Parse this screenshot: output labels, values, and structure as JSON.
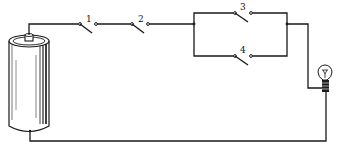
{
  "diagram": {
    "type": "electrical circuit",
    "components": {
      "battery": {
        "name": "dry cell battery"
      },
      "bulb": {
        "name": "light bulb"
      },
      "switches": [
        {
          "id": "switch-1",
          "label": "1",
          "arrangement": "series",
          "state": "open"
        },
        {
          "id": "switch-2",
          "label": "2",
          "arrangement": "series",
          "state": "open"
        },
        {
          "id": "switch-3",
          "label": "3",
          "arrangement": "parallel-upper",
          "state": "open"
        },
        {
          "id": "switch-4",
          "label": "4",
          "arrangement": "parallel-lower",
          "state": "open"
        }
      ]
    },
    "colors": {
      "line": "#1a1a1a",
      "background": "#ffffff"
    }
  }
}
